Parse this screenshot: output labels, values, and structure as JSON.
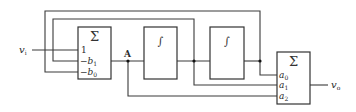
{
  "diagram": {
    "type": "block-diagram",
    "input_signal": "v",
    "input_sub": "i",
    "output_signal": "v",
    "output_sub": "o",
    "node_label": "A",
    "blocks": {
      "sum_left": {
        "symbol": "Σ",
        "inputs": [
          {
            "sign": "",
            "coef": "1",
            "sub": ""
          },
          {
            "sign": "−",
            "coef": "b",
            "sub": "1"
          },
          {
            "sign": "−",
            "coef": "b",
            "sub": "0"
          }
        ]
      },
      "integrator_1": {
        "symbol": "∫"
      },
      "integrator_2": {
        "symbol": "∫"
      },
      "sum_right": {
        "symbol": "Σ",
        "inputs": [
          {
            "coef": "a",
            "sub": "0"
          },
          {
            "coef": "a",
            "sub": "1"
          },
          {
            "coef": "a",
            "sub": "2"
          }
        ]
      }
    },
    "colors": {
      "line": "#3a3a3a",
      "background": "#ffffff"
    }
  }
}
